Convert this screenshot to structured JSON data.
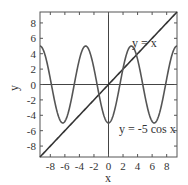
{
  "chart_data": {
    "type": "line",
    "title": "",
    "xlabel": "x",
    "ylabel": "y",
    "xlim": [
      -9.42,
      9.42
    ],
    "ylim": [
      -9.42,
      9.42
    ],
    "xticks": [
      "-8",
      "-6",
      "-4",
      "-2",
      "0",
      "2",
      "4",
      "6",
      "8"
    ],
    "yticks": [
      "-8",
      "-6",
      "-4",
      "-2",
      "0",
      "2",
      "4",
      "6",
      "8"
    ],
    "grid": false,
    "series": [
      {
        "name": "y = x",
        "expression": "x",
        "color": "#333333"
      },
      {
        "name": "y = -5 cos x",
        "expression": "-5*cos(x)",
        "color": "#555555"
      }
    ],
    "annotations": [
      {
        "text": "y = x",
        "x": 3.5,
        "y": 6.5
      },
      {
        "text": "y = -5 cos x",
        "x": 4.5,
        "y": -6.5
      }
    ],
    "axes_lines": {
      "x0": true,
      "y0": true
    }
  }
}
